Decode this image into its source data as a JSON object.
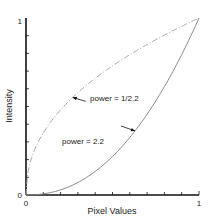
{
  "chart_data": {
    "type": "line",
    "title": "",
    "xlabel": "Pixel Values",
    "ylabel": "Intensity",
    "xlim": [
      0,
      1
    ],
    "ylim": [
      0,
      1
    ],
    "x_ticks": [
      "0",
      "1"
    ],
    "y_ticks": [
      "0",
      "1"
    ],
    "grid": false,
    "series": [
      {
        "name": "power = 1/2.2",
        "exponent": 0.4545,
        "style": "dash-dot",
        "color": "#aaaaaa"
      },
      {
        "name": "power = 2.2",
        "exponent": 2.2,
        "style": "solid",
        "color": "#888888"
      }
    ],
    "annotations": [
      {
        "text": "power = 1/2.2",
        "points_to": "power = 1/2.2",
        "at_x": 0.27
      },
      {
        "text": "power = 2.2",
        "points_to": "power = 2.2",
        "at_x": 0.63
      }
    ]
  }
}
